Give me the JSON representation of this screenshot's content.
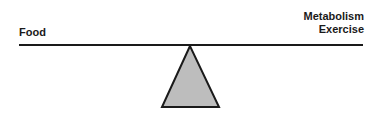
{
  "diagram": {
    "left_side": {
      "label": "Food"
    },
    "right_side": {
      "labels": [
        "Metabolism",
        "Exercise"
      ]
    },
    "colors": {
      "beam": "#1a1a1a",
      "fulcrum_fill": "#bdbdbd",
      "fulcrum_stroke": "#1a1a1a"
    }
  }
}
